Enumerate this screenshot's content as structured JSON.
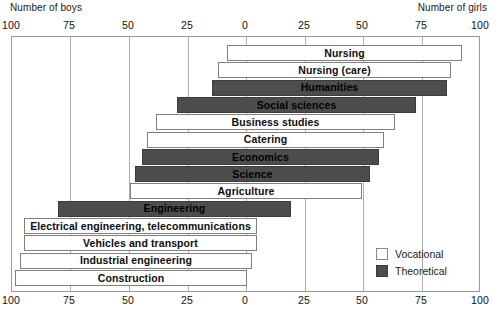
{
  "header": {
    "left_label": "Number of boys",
    "right_label": "Number of girls"
  },
  "axis": {
    "top_ticks": [
      "100",
      "75",
      "50",
      "25",
      "0",
      "25",
      "50",
      "75",
      "100"
    ],
    "bottom_ticks": [
      "100",
      "75",
      "50",
      "25",
      "0",
      "25",
      "50",
      "75",
      "100"
    ],
    "tick_positions_px": [
      11,
      69,
      128,
      187,
      245,
      304,
      362,
      421,
      480
    ],
    "zero_px": 245,
    "px_per_unit": 2.35
  },
  "legend": {
    "items": [
      {
        "label": "Vocational",
        "type": "vocational",
        "color": "#ffffff"
      },
      {
        "label": "Theoretical",
        "type": "theoretical",
        "color": "#4d4d4d"
      }
    ]
  },
  "chart_data": {
    "type": "bar",
    "title": "",
    "subtitle": "",
    "orientation": "horizontal-diverging",
    "xlabel_left": "Number of boys",
    "xlabel_right": "Number of girls",
    "ylabel": "",
    "xlim": [
      100,
      100
    ],
    "unit": "percent",
    "grid": true,
    "legend_position": "bottom-right",
    "categories": [
      "Nursing",
      "Nursing (care)",
      "Humanities",
      "Social sciences",
      "Business studies",
      "Catering",
      "Economics",
      "Science",
      "Agriculture",
      "Engineering",
      "Electrical engineering, telecommunications",
      "Vehicles and transport",
      "Industrial engineering",
      "Construction"
    ],
    "series": [
      {
        "name": "Number of boys",
        "values": [
          8,
          12,
          14,
          29,
          38,
          42,
          44,
          47,
          49,
          80,
          94,
          94,
          96,
          98
        ]
      },
      {
        "name": "Number of girls",
        "values": [
          92,
          87,
          86,
          72,
          63,
          59,
          57,
          53,
          49,
          19,
          5,
          5,
          3,
          0
        ]
      }
    ],
    "bars": [
      {
        "label": "Nursing",
        "type": "vocational",
        "boys": 8,
        "girls": 92,
        "left_px": 226,
        "right_px": 461
      },
      {
        "label": "Nursing (care)",
        "type": "vocational",
        "boys": 12,
        "girls": 87,
        "left_px": 217,
        "right_px": 450
      },
      {
        "label": "Humanities",
        "type": "theoretical",
        "boys": 14,
        "girls": 86,
        "left_px": 211,
        "right_px": 446
      },
      {
        "label": "Social sciences",
        "type": "theoretical",
        "boys": 29,
        "girls": 72,
        "left_px": 176,
        "right_px": 415
      },
      {
        "label": "Business studies",
        "type": "vocational",
        "boys": 38,
        "girls": 63,
        "left_px": 155,
        "right_px": 394
      },
      {
        "label": "Catering",
        "type": "vocational",
        "boys": 42,
        "girls": 59,
        "left_px": 146,
        "right_px": 383
      },
      {
        "label": "Economics",
        "type": "theoretical",
        "boys": 44,
        "girls": 57,
        "left_px": 141,
        "right_px": 378
      },
      {
        "label": "Science",
        "type": "theoretical",
        "boys": 47,
        "girls": 53,
        "left_px": 134,
        "right_px": 369
      },
      {
        "label": "Agriculture",
        "type": "vocational",
        "boys": 49,
        "girls": 49,
        "left_px": 129,
        "right_px": 361
      },
      {
        "label": "Engineering",
        "type": "theoretical",
        "boys": 80,
        "girls": 19,
        "left_px": 57,
        "right_px": 290
      },
      {
        "label": "Electrical engineering, telecommunications",
        "type": "vocational",
        "boys": 94,
        "girls": 5,
        "left_px": 23,
        "right_px": 256
      },
      {
        "label": "Vehicles and transport",
        "type": "vocational",
        "boys": 94,
        "girls": 5,
        "left_px": 23,
        "right_px": 256
      },
      {
        "label": "Industrial engineering",
        "type": "vocational",
        "boys": 96,
        "girls": 3,
        "left_px": 19,
        "right_px": 251
      },
      {
        "label": "Construction",
        "type": "vocational",
        "boys": 98,
        "girls": 0,
        "left_px": 14,
        "right_px": 246
      }
    ]
  }
}
